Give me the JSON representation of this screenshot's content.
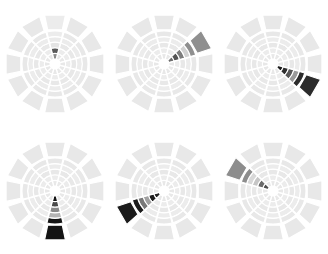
{
  "figure": {
    "type": "small-multiples",
    "panel_count": 6,
    "rows": 2,
    "columns": 3,
    "background_color": "#ffffff"
  },
  "palette": {
    "base_fill": "#e8e8e8",
    "base_fill_alt": "#ececec",
    "divider": "#ffffff",
    "hub": "#ffffff",
    "level_0": "#e8e8e8",
    "level_1": "#bdbdbd",
    "level_2": "#969696",
    "level_3": "#636363",
    "level_4": "#3f3f3f",
    "level_5": "#1a1a1a"
  },
  "chart_data": {
    "type": "heatmap",
    "title": "",
    "subtitle": "",
    "xlabel": "",
    "ylabel": "",
    "grid": false,
    "legend_position": "none",
    "n_sectors": 12,
    "n_rings": 5,
    "sector_angles_deg": [
      0,
      30,
      60,
      90,
      120,
      150,
      180,
      210,
      240,
      270,
      300,
      330
    ],
    "ring_labels": [
      "r1",
      "r2",
      "r3",
      "r4",
      "r5"
    ],
    "panels": [
      {
        "id": "panel-1",
        "label": "",
        "highlight_sector_index": 0,
        "highlight_angle_deg": 0,
        "highlight_direction": "up",
        "values": [
          0.55,
          0.62,
          0.1,
          0.05,
          0.03
        ],
        "colors": [
          "#8c8c8c",
          "#5a5a5a",
          "#e4e4e4",
          "#eaeaea",
          "#ececec"
        ]
      },
      {
        "id": "panel-2",
        "label": "",
        "highlight_sector_index": 2,
        "highlight_angle_deg": 60,
        "highlight_direction": "upper-right",
        "values": [
          0.62,
          0.7,
          0.55,
          0.2,
          0.62
        ],
        "colors": [
          "#6e6e6e",
          "#545454",
          "#7d7d7d",
          "#d2d2d2",
          "#8f8f8f"
        ]
      },
      {
        "id": "panel-3",
        "label": "",
        "highlight_sector_index": 4,
        "highlight_angle_deg": 120,
        "highlight_direction": "lower-right",
        "values": [
          0.92,
          0.86,
          0.7,
          0.5,
          0.9
        ],
        "colors": [
          "#1e1e1e",
          "#2e2e2e",
          "#585858",
          "#9a9a9a",
          "#2b2b2b"
        ]
      },
      {
        "id": "panel-4",
        "label": "",
        "highlight_sector_index": 6,
        "highlight_angle_deg": 180,
        "highlight_direction": "down",
        "values": [
          0.95,
          0.72,
          0.5,
          0.35,
          0.95
        ],
        "colors": [
          "#141414",
          "#4a4a4a",
          "#8a8a8a",
          "#b4b4b4",
          "#141414"
        ]
      },
      {
        "id": "panel-5",
        "label": "",
        "highlight_sector_index": 8,
        "highlight_angle_deg": 240,
        "highlight_direction": "lower-left",
        "values": [
          0.9,
          0.92,
          0.45,
          0.6,
          0.92
        ],
        "colors": [
          "#232323",
          "#1b1b1b",
          "#a0a0a0",
          "#787878",
          "#1b1b1b"
        ]
      },
      {
        "id": "panel-6",
        "label": "",
        "highlight_sector_index": 10,
        "highlight_angle_deg": 300,
        "highlight_direction": "upper-left",
        "values": [
          0.7,
          0.62,
          0.25,
          0.18,
          0.62
        ],
        "colors": [
          "#4f4f4f",
          "#6b6b6b",
          "#c6c6c6",
          "#d8d8d8",
          "#8d8d8d"
        ]
      }
    ]
  }
}
